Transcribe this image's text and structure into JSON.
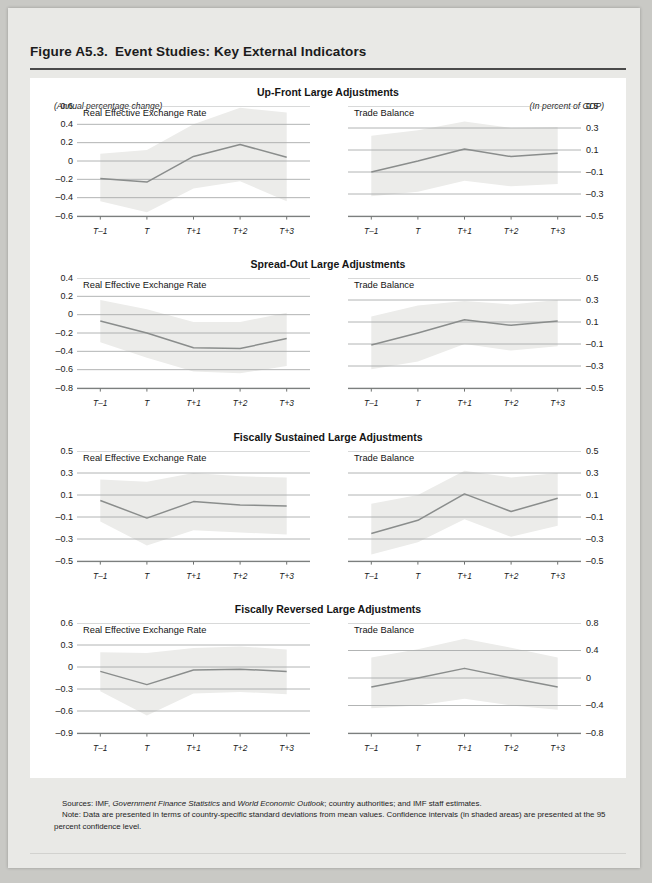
{
  "figure": {
    "number": "Figure A5.3.",
    "title": "Event Studies: Key External Indicators",
    "units_left": "(Annual percentage change)",
    "units_right": "(In percent of GDP)"
  },
  "series_labels": {
    "reer": "Real Effective Exchange Rate",
    "tb": "Trade Balance"
  },
  "xticks": [
    "T–1",
    "T",
    "T+1",
    "T+2",
    "T+3"
  ],
  "notes": {
    "sources_label": "Sources:",
    "sources_text_1": "IMF, ",
    "sources_italic_1": "Government Finance Statistics",
    "sources_text_2": " and ",
    "sources_italic_2": "World Economic Outlook",
    "sources_text_3": "; country authorities; and IMF staff estimates.",
    "note_label": "Note:",
    "note_text": "Data are presented in terms of country-specific standard deviations from mean values. Confidence intervals (in shaded areas) are presented at the 95 percent confidence level."
  },
  "colors": {
    "line": "#8a8d8c",
    "band": "#ececea",
    "grid": "#a9acab",
    "axis": "#6f7271",
    "panel_bg": "#ffffff",
    "page_bg": "#e9e9e6",
    "outer_bg": "#c9c9c5",
    "rule": "#4a4a4a",
    "text": "#141414"
  },
  "chart_data": [
    {
      "type": "line",
      "panel": "Up-Front Large Adjustments",
      "side": "left",
      "title": "Real Effective Exchange Rate",
      "x": [
        "T–1",
        "T",
        "T+1",
        "T+2",
        "T+3"
      ],
      "values": [
        -0.19,
        -0.23,
        0.05,
        0.18,
        0.04
      ],
      "band_upper": [
        0.08,
        0.12,
        0.4,
        0.58,
        0.53
      ],
      "band_lower": [
        -0.44,
        -0.56,
        -0.3,
        -0.22,
        -0.44
      ],
      "yticks": [
        0.6,
        0.4,
        0.2,
        0,
        -0.2,
        -0.4,
        -0.6
      ],
      "ytick_labels": [
        "0.6",
        "0.4",
        "0.2",
        "0",
        "–0.2",
        "–0.4",
        "–0.6"
      ],
      "ylim": [
        -0.6,
        0.6
      ],
      "grid": true,
      "legend": "none"
    },
    {
      "type": "line",
      "panel": "Up-Front Large Adjustments",
      "side": "right",
      "title": "Trade Balance",
      "x": [
        "T–1",
        "T",
        "T+1",
        "T+2",
        "T+3"
      ],
      "values": [
        -0.1,
        0.0,
        0.11,
        0.04,
        0.07
      ],
      "band_upper": [
        0.23,
        0.28,
        0.36,
        0.3,
        0.31
      ],
      "band_lower": [
        -0.32,
        -0.28,
        -0.18,
        -0.23,
        -0.21
      ],
      "yticks": [
        0.5,
        0.3,
        0.1,
        -0.1,
        -0.3,
        -0.5
      ],
      "ytick_labels": [
        "0.5",
        "0.3",
        "0.1",
        "–0.1",
        "–0.3",
        "–0.5"
      ],
      "ylim": [
        -0.5,
        0.5
      ],
      "grid": true,
      "legend": "none"
    },
    {
      "type": "line",
      "panel": "Spread-Out Large Adjustments",
      "side": "left",
      "title": "Real Effective Exchange Rate",
      "x": [
        "T–1",
        "T",
        "T+1",
        "T+2",
        "T+3"
      ],
      "values": [
        -0.07,
        -0.2,
        -0.36,
        -0.37,
        -0.26
      ],
      "band_upper": [
        0.16,
        0.06,
        -0.08,
        -0.08,
        0.02
      ],
      "band_lower": [
        -0.3,
        -0.47,
        -0.62,
        -0.64,
        -0.56
      ],
      "yticks": [
        0.4,
        0.2,
        0,
        -0.2,
        -0.4,
        -0.6,
        -0.8
      ],
      "ytick_labels": [
        "0.4",
        "0.2",
        "0",
        "–0.2",
        "–0.4",
        "–0.6",
        "–0.8"
      ],
      "ylim": [
        -0.8,
        0.4
      ],
      "grid": true,
      "legend": "none"
    },
    {
      "type": "line",
      "panel": "Spread-Out Large Adjustments",
      "side": "right",
      "title": "Trade Balance",
      "x": [
        "T–1",
        "T",
        "T+1",
        "T+2",
        "T+3"
      ],
      "values": [
        -0.11,
        0.0,
        0.12,
        0.07,
        0.11
      ],
      "band_upper": [
        0.15,
        0.25,
        0.29,
        0.26,
        0.3
      ],
      "band_lower": [
        -0.33,
        -0.26,
        -0.1,
        -0.16,
        -0.12
      ],
      "yticks": [
        0.5,
        0.3,
        0.1,
        -0.1,
        -0.3,
        -0.5
      ],
      "ytick_labels": [
        "0.5",
        "0.3",
        "0.1",
        "–0.1",
        "–0.3",
        "–0.5"
      ],
      "ylim": [
        -0.5,
        0.5
      ],
      "grid": true,
      "legend": "none"
    },
    {
      "type": "line",
      "panel": "Fiscally Sustained Large Adjustments",
      "side": "left",
      "title": "Real Effective Exchange Rate",
      "x": [
        "T–1",
        "T",
        "T+1",
        "T+2",
        "T+3"
      ],
      "values": [
        0.05,
        -0.11,
        0.04,
        0.01,
        0.0
      ],
      "band_upper": [
        0.24,
        0.22,
        0.3,
        0.27,
        0.26
      ],
      "band_lower": [
        -0.14,
        -0.36,
        -0.22,
        -0.24,
        -0.26
      ],
      "yticks": [
        0.5,
        0.3,
        0.1,
        -0.1,
        -0.3,
        -0.5
      ],
      "ytick_labels": [
        "0.5",
        "0.3",
        "0.1",
        "–0.1",
        "–0.3",
        "–0.5"
      ],
      "ylim": [
        -0.5,
        0.5
      ],
      "grid": true,
      "legend": "none"
    },
    {
      "type": "line",
      "panel": "Fiscally Sustained Large Adjustments",
      "side": "right",
      "title": "Trade Balance",
      "x": [
        "T–1",
        "T",
        "T+1",
        "T+2",
        "T+3"
      ],
      "values": [
        -0.25,
        -0.13,
        0.11,
        -0.05,
        0.07
      ],
      "band_upper": [
        0.02,
        0.1,
        0.32,
        0.26,
        0.3
      ],
      "band_lower": [
        -0.44,
        -0.33,
        -0.12,
        -0.28,
        -0.18
      ],
      "yticks": [
        0.5,
        0.3,
        0.1,
        -0.1,
        -0.3,
        -0.5
      ],
      "ytick_labels": [
        "0.5",
        "0.3",
        "0.1",
        "–0.1",
        "–0.3",
        "–0.5"
      ],
      "ylim": [
        -0.5,
        0.5
      ],
      "grid": true,
      "legend": "none"
    },
    {
      "type": "line",
      "panel": "Fiscally Reversed Large Adjustments",
      "side": "left",
      "title": "Real Effective Exchange Rate",
      "x": [
        "T–1",
        "T",
        "T+1",
        "T+2",
        "T+3"
      ],
      "values": [
        -0.06,
        -0.24,
        -0.04,
        -0.03,
        -0.06
      ],
      "band_upper": [
        0.2,
        0.19,
        0.26,
        0.28,
        0.24
      ],
      "band_lower": [
        -0.33,
        -0.66,
        -0.36,
        -0.34,
        -0.37
      ],
      "yticks": [
        0.6,
        0.3,
        0,
        -0.3,
        -0.6,
        -0.9
      ],
      "ytick_labels": [
        "0.6",
        "0.3",
        "0",
        "–0.3",
        "–0.6",
        "–0.9"
      ],
      "ylim": [
        -0.9,
        0.6
      ],
      "grid": true,
      "legend": "none"
    },
    {
      "type": "line",
      "panel": "Fiscally Reversed Large Adjustments",
      "side": "right",
      "title": "Trade Balance",
      "x": [
        "T–1",
        "T",
        "T+1",
        "T+2",
        "T+3"
      ],
      "values": [
        -0.13,
        0.0,
        0.14,
        0.0,
        -0.13
      ],
      "band_upper": [
        0.3,
        0.42,
        0.57,
        0.44,
        0.3
      ],
      "band_lower": [
        -0.44,
        -0.4,
        -0.3,
        -0.4,
        -0.46
      ],
      "yticks": [
        0.8,
        0.4,
        0,
        -0.4,
        -0.8
      ],
      "ytick_labels": [
        "0.8",
        "0.4",
        "0",
        "–0.4",
        "–0.8"
      ],
      "ylim": [
        -0.8,
        0.8
      ],
      "grid": true,
      "legend": "none"
    }
  ],
  "panels": [
    {
      "title": "Up-Front Large Adjustments"
    },
    {
      "title": "Spread-Out Large Adjustments"
    },
    {
      "title": "Fiscally Sustained Large Adjustments"
    },
    {
      "title": "Fiscally Reversed Large Adjustments"
    }
  ]
}
